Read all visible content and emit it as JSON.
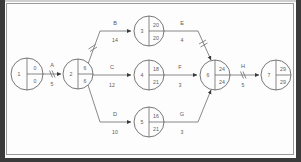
{
  "diagram": {
    "type": "pert-cpm-network",
    "nodes": [
      {
        "id": "1",
        "early": "0",
        "late": "0",
        "cx": 27,
        "cy": 74,
        "r": 16
      },
      {
        "id": "2",
        "early": "6",
        "late": "6",
        "cx": 78,
        "cy": 74,
        "r": 15
      },
      {
        "id": "3",
        "early": "20",
        "late": "20",
        "cx": 149,
        "cy": 31,
        "r": 15
      },
      {
        "id": "4",
        "early": "18",
        "late": "21",
        "cx": 149,
        "cy": 75,
        "r": 15
      },
      {
        "id": "5",
        "early": "16",
        "late": "21",
        "cx": 149,
        "cy": 122,
        "r": 15
      },
      {
        "id": "6",
        "early": "24",
        "late": "24",
        "cx": 215,
        "cy": 75,
        "r": 15
      },
      {
        "id": "7",
        "early": "29",
        "late": "29",
        "cx": 276,
        "cy": 75,
        "r": 15
      }
    ],
    "edges": [
      {
        "label": "A",
        "duration": "5",
        "from": "1",
        "to": "2",
        "has_tick": true
      },
      {
        "label": "B",
        "duration": "14",
        "from": "2",
        "to": "3",
        "has_tick": true
      },
      {
        "label": "C",
        "duration": "12",
        "from": "2",
        "to": "4",
        "has_tick": false
      },
      {
        "label": "D",
        "duration": "10",
        "from": "2",
        "to": "5",
        "has_tick": false
      },
      {
        "label": "E",
        "duration": "4",
        "from": "3",
        "to": "6",
        "has_tick": true
      },
      {
        "label": "F",
        "duration": "3",
        "from": "4",
        "to": "6",
        "has_tick": false
      },
      {
        "label": "G",
        "duration": "3",
        "from": "5",
        "to": "6",
        "has_tick": false
      },
      {
        "label": "H",
        "duration": "5",
        "from": "6",
        "to": "7",
        "has_tick": true
      }
    ],
    "colors": {
      "line": "#6b6b6b",
      "node_stroke": "#555555",
      "text": "#5a5a5a",
      "frame": "#3a3a3a",
      "background": "#fdfdfd"
    }
  }
}
